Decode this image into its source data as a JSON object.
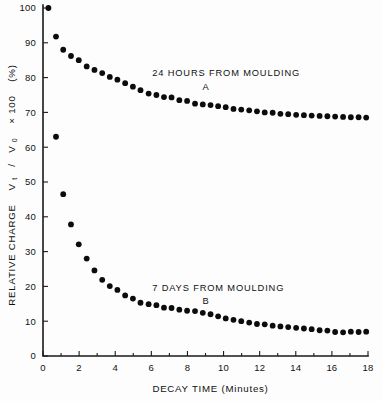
{
  "chart_data": {
    "type": "scatter",
    "title": "",
    "xlabel": "DECAY TIME (Minutes)",
    "ylabel": "RELATIVE CHARGE  V_t / V_0  × 100  (%)",
    "ylabel_parts": {
      "prefix": "RELATIVE CHARGE",
      "symbol_v_t": "V",
      "sub_t": "t",
      "slash": "/",
      "symbol_v_0": "V",
      "sub_0": "0",
      "times": "× 100",
      "units": "(%)"
    },
    "xlim": [
      0,
      18
    ],
    "ylim": [
      0,
      100
    ],
    "xticks": [
      0,
      2,
      4,
      6,
      8,
      10,
      12,
      14,
      16,
      18
    ],
    "xtick_labels": [
      "0",
      "2",
      "4",
      "6",
      "8",
      "10",
      "12",
      "14",
      "16",
      "18"
    ],
    "xminor_ticks": [
      1,
      3,
      5,
      7,
      9,
      11,
      13,
      15,
      17
    ],
    "yticks": [
      0,
      10,
      20,
      30,
      40,
      50,
      60,
      70,
      80,
      90,
      100
    ],
    "ytick_labels": [
      "0",
      "10",
      "20",
      "30",
      "40",
      "50",
      "60",
      "70",
      "80",
      "90",
      "100"
    ],
    "grid": false,
    "legend_position": "inline-annotation",
    "marker": "filled-circle",
    "marker_color": "#0c0c0c",
    "series": [
      {
        "name": "A",
        "label": "24 HOURS FROM MOULDING",
        "letter": "A",
        "annotation_x": 6.05,
        "annotation_y": 80.5,
        "letter_x": 9.0,
        "letter_y": 76.5,
        "x": [
          0.3,
          0.72,
          1.12,
          1.55,
          1.98,
          2.42,
          2.85,
          3.28,
          3.7,
          4.12,
          4.55,
          4.98,
          5.4,
          5.85,
          6.28,
          6.7,
          7.12,
          7.55,
          7.98,
          8.42,
          8.85,
          9.28,
          9.7,
          10.12,
          10.55,
          10.98,
          11.42,
          11.85,
          12.28,
          12.72,
          13.15,
          13.58,
          14.02,
          14.45,
          14.88,
          15.32,
          15.75,
          16.18,
          16.62,
          17.05,
          17.48,
          17.9
        ],
        "y": [
          100.0,
          91.8,
          88.0,
          86.2,
          85.0,
          83.2,
          82.2,
          81.3,
          80.2,
          79.4,
          78.4,
          77.4,
          76.4,
          75.4,
          75.0,
          74.4,
          74.3,
          73.5,
          73.3,
          72.5,
          72.3,
          72.1,
          71.8,
          71.5,
          71.0,
          70.8,
          70.6,
          70.3,
          70.0,
          69.9,
          69.6,
          69.5,
          69.3,
          69.2,
          69.1,
          69.0,
          68.9,
          68.8,
          68.7,
          68.6,
          68.6,
          68.5
        ]
      },
      {
        "name": "B",
        "label": "7 DAYS FROM MOULDING",
        "letter": "B",
        "annotation_x": 6.05,
        "annotation_y": 18.8,
        "letter_x": 9.0,
        "letter_y": 14.8,
        "x": [
          0.72,
          1.12,
          1.55,
          1.98,
          2.42,
          2.85,
          3.28,
          3.7,
          4.12,
          4.55,
          4.98,
          5.4,
          5.85,
          6.28,
          6.7,
          7.12,
          7.55,
          7.98,
          8.42,
          8.85,
          9.28,
          9.7,
          10.12,
          10.55,
          10.98,
          11.42,
          11.85,
          12.28,
          12.72,
          13.15,
          13.58,
          14.02,
          14.45,
          14.88,
          15.32,
          15.75,
          16.18,
          16.62,
          17.05,
          17.48,
          17.9
        ],
        "y": [
          63.0,
          46.5,
          37.8,
          32.1,
          28.0,
          24.6,
          21.9,
          20.1,
          19.0,
          17.4,
          16.5,
          15.3,
          14.9,
          14.6,
          13.9,
          13.8,
          13.3,
          13.0,
          12.9,
          12.4,
          12.0,
          11.4,
          10.8,
          10.4,
          10.0,
          9.6,
          9.2,
          9.1,
          8.7,
          8.5,
          8.3,
          8.1,
          7.9,
          7.7,
          7.4,
          7.3,
          6.9,
          6.8,
          7.0,
          6.9,
          7.0
        ]
      }
    ]
  }
}
